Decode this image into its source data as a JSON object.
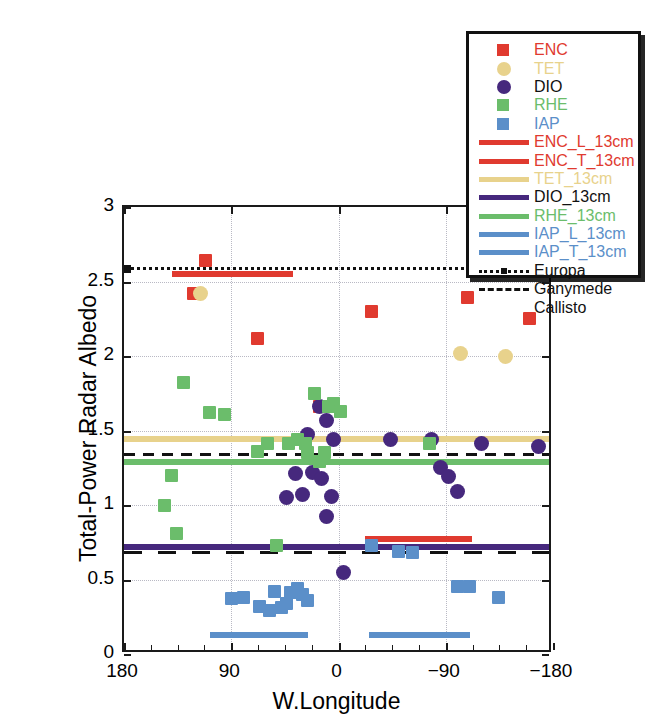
{
  "chart_data": {
    "type": "scatter",
    "title": "",
    "xlabel": "W.Longitude",
    "ylabel": "Total-Power Radar Albedo",
    "xlim": [
      180,
      -180
    ],
    "ylim": [
      0,
      3
    ],
    "xticks": [
      180,
      90,
      0,
      -90,
      -180
    ],
    "xtick_labels": [
      "180",
      "90",
      "0",
      "−90",
      "−180"
    ],
    "yticks": [
      0,
      0.5,
      1,
      1.5,
      2,
      2.5,
      3
    ],
    "ytick_labels": [
      "0",
      "0.5",
      "1",
      "1.5",
      "2",
      "2.5",
      "3"
    ],
    "grid": true,
    "legend_position": "top-right",
    "series": [
      {
        "name": "ENC",
        "marker": "square",
        "color": "#e03a2f",
        "points": [
          [
            112,
            2.64
          ],
          [
            122,
            2.42
          ],
          [
            68,
            2.12
          ],
          [
            16,
            1.66
          ],
          [
            -28,
            2.3
          ],
          [
            -108,
            2.39
          ],
          [
            -160,
            2.25
          ]
        ]
      },
      {
        "name": "TET",
        "marker": "circle",
        "color": "#e8d28c",
        "points": [
          [
            116,
            2.42
          ],
          [
            -102,
            2.02
          ],
          [
            -140,
            2.0
          ]
        ]
      },
      {
        "name": "DIO",
        "marker": "circle",
        "color": "#46287d",
        "points": [
          [
            16,
            1.66
          ],
          [
            26,
            1.47
          ],
          [
            10,
            1.57
          ],
          [
            4,
            1.44
          ],
          [
            22,
            1.22
          ],
          [
            14,
            1.18
          ],
          [
            36,
            1.21
          ],
          [
            30,
            1.07
          ],
          [
            44,
            1.05
          ],
          [
            6,
            1.06
          ],
          [
            10,
            0.92
          ],
          [
            -44,
            1.44
          ],
          [
            -78,
            1.44
          ],
          [
            -86,
            1.25
          ],
          [
            -92,
            1.19
          ],
          [
            -100,
            1.09
          ],
          [
            -120,
            1.41
          ],
          [
            -168,
            1.39
          ],
          [
            -4,
            0.55
          ]
        ]
      },
      {
        "name": "RHE",
        "marker": "square",
        "color": "#6bbd6b",
        "points": [
          [
            130,
            1.82
          ],
          [
            108,
            1.62
          ],
          [
            96,
            1.61
          ],
          [
            140,
            1.2
          ],
          [
            146,
            1.0
          ],
          [
            136,
            0.81
          ],
          [
            68,
            1.36
          ],
          [
            60,
            1.41
          ],
          [
            42,
            1.41
          ],
          [
            20,
            1.75
          ],
          [
            8,
            1.66
          ],
          [
            28,
            1.41
          ],
          [
            34,
            1.44
          ],
          [
            16,
            1.29
          ],
          [
            4,
            1.68
          ],
          [
            -2,
            1.63
          ],
          [
            26,
            1.35
          ],
          [
            12,
            1.35
          ],
          [
            -76,
            1.41
          ],
          [
            52,
            0.73
          ]
        ]
      },
      {
        "name": "IAP",
        "marker": "square",
        "color": "#5b8fc9",
        "points": [
          [
            90,
            0.37
          ],
          [
            80,
            0.38
          ],
          [
            66,
            0.32
          ],
          [
            58,
            0.29
          ],
          [
            54,
            0.42
          ],
          [
            48,
            0.31
          ],
          [
            44,
            0.34
          ],
          [
            40,
            0.41
          ],
          [
            34,
            0.44
          ],
          [
            30,
            0.4
          ],
          [
            26,
            0.36
          ],
          [
            -28,
            0.73
          ],
          [
            -50,
            0.69
          ],
          [
            -62,
            0.68
          ],
          [
            -100,
            0.45
          ],
          [
            -110,
            0.45
          ],
          [
            -134,
            0.38
          ]
        ]
      }
    ],
    "reference_lines": [
      {
        "label": "ENC_L_13cm",
        "value": 2.55,
        "color": "#e03a2f",
        "style": "solid",
        "x_start": 140,
        "x_end": 38
      },
      {
        "label": "ENC_T_13cm",
        "value": 0.77,
        "color": "#e03a2f",
        "style": "solid",
        "x_start": -22,
        "x_end": -112
      },
      {
        "label": "TET_13cm",
        "value": 1.44,
        "color": "#e8d28c",
        "style": "solid",
        "x_start": 180,
        "x_end": -180
      },
      {
        "label": "DIO_13cm",
        "value": 0.72,
        "color": "#46287d",
        "style": "solid",
        "x_start": 180,
        "x_end": -180
      },
      {
        "label": "RHE_13cm",
        "value": 1.29,
        "color": "#6bbd6b",
        "style": "solid",
        "x_start": 180,
        "x_end": -180
      },
      {
        "label": "IAP_L_13cm",
        "value": 0.13,
        "color": "#5b8fc9",
        "style": "solid",
        "x_start": 108,
        "x_end": 26
      },
      {
        "label": "IAP_T_13cm",
        "value": 0.13,
        "color": "#5b8fc9",
        "style": "solid",
        "x_start": -26,
        "x_end": -110
      },
      {
        "label": "Europa",
        "value": 2.6,
        "color": "#111111",
        "style": "dotted",
        "x_start": 180,
        "x_end": -180
      },
      {
        "label": "Ganymede",
        "value": 1.35,
        "color": "#111111",
        "style": "dashed-short",
        "x_start": 180,
        "x_end": -180
      },
      {
        "label": "Callisto",
        "value": 0.69,
        "color": "#111111",
        "style": "dashed-long",
        "x_start": 180,
        "x_end": -180
      }
    ]
  },
  "legend": {
    "entries": [
      {
        "label": "ENC",
        "key": "square",
        "color": "#e03a2f",
        "text_color": "#e03a2f"
      },
      {
        "label": "TET",
        "key": "circle",
        "color": "#e8d28c",
        "text_color": "#e8d28c"
      },
      {
        "label": "DIO",
        "key": "circle",
        "color": "#46287d",
        "text_color": "#111111"
      },
      {
        "label": "RHE",
        "key": "square",
        "color": "#6bbd6b",
        "text_color": "#6bbd6b"
      },
      {
        "label": "IAP",
        "key": "square",
        "color": "#5b8fc9",
        "text_color": "#5b8fc9"
      },
      {
        "label": "ENC_L_13cm",
        "key": "line",
        "color": "#e03a2f",
        "text_color": "#e03a2f"
      },
      {
        "label": "ENC_T_13cm",
        "key": "line",
        "color": "#e03a2f",
        "text_color": "#e03a2f"
      },
      {
        "label": "TET_13cm",
        "key": "line",
        "color": "#e8d28c",
        "text_color": "#e8d28c"
      },
      {
        "label": "DIO_13cm",
        "key": "line",
        "color": "#46287d",
        "text_color": "#111111"
      },
      {
        "label": "RHE_13cm",
        "key": "line",
        "color": "#6bbd6b",
        "text_color": "#6bbd6b"
      },
      {
        "label": "IAP_L_13cm",
        "key": "line",
        "color": "#5b8fc9",
        "text_color": "#5b8fc9"
      },
      {
        "label": "IAP_T_13cm",
        "key": "line",
        "color": "#5b8fc9",
        "text_color": "#5b8fc9"
      },
      {
        "label": "Europa",
        "key": "dotted-marker",
        "color": "#111111",
        "text_color": "#111111"
      },
      {
        "label": "Ganymede",
        "key": "dashed-short",
        "color": "#111111",
        "text_color": "#111111"
      },
      {
        "label": "Callisto",
        "key": "dashed-long",
        "color": "#111111",
        "text_color": "#111111"
      }
    ]
  }
}
